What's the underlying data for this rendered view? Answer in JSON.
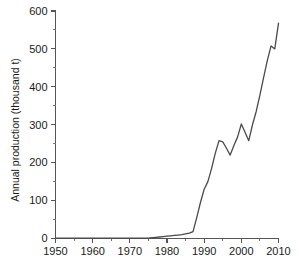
{
  "chart_data": {
    "type": "line",
    "title": "",
    "subtitle": "",
    "xlabel": "",
    "ylabel": "Annual production (thousand t)",
    "xlim": [
      1950,
      2010
    ],
    "ylim": [
      0,
      600
    ],
    "grid": false,
    "legend": null,
    "x_ticks": [
      1950,
      1960,
      1970,
      1980,
      1990,
      2000,
      2010
    ],
    "x_tick_labels": [
      "1950",
      "1960",
      "1970",
      "1980",
      "1990",
      "2000",
      "2010"
    ],
    "x_minor_step": 5,
    "y_ticks": [
      0,
      100,
      200,
      300,
      400,
      500,
      600
    ],
    "y_tick_labels": [
      "0",
      "100",
      "200",
      "300",
      "400",
      "500",
      "600"
    ],
    "y_minor_step": 50,
    "line_color": "#4a4a4a",
    "series": [
      {
        "name": "Annual production",
        "x": [
          1950,
          1951,
          1952,
          1953,
          1954,
          1955,
          1956,
          1957,
          1958,
          1959,
          1960,
          1961,
          1962,
          1963,
          1964,
          1965,
          1966,
          1967,
          1968,
          1969,
          1970,
          1971,
          1972,
          1973,
          1974,
          1975,
          1976,
          1977,
          1978,
          1979,
          1980,
          1981,
          1982,
          1983,
          1984,
          1985,
          1986,
          1987,
          1988,
          1989,
          1990,
          1991,
          1992,
          1993,
          1994,
          1995,
          1996,
          1997,
          1998,
          1999,
          2000,
          2001,
          2002,
          2003,
          2004,
          2005,
          2006,
          2007,
          2008,
          2009,
          2010
        ],
        "y": [
          1,
          1,
          1,
          1,
          1,
          1,
          1,
          1,
          1,
          1,
          1,
          1,
          1,
          1,
          1,
          1,
          1,
          1,
          1,
          1,
          1,
          1,
          1,
          1,
          1,
          1,
          2,
          3,
          4,
          5,
          6,
          7,
          8,
          9,
          10,
          12,
          14,
          18,
          55,
          95,
          130,
          150,
          185,
          225,
          258,
          255,
          238,
          220,
          245,
          268,
          302,
          280,
          258,
          300,
          335,
          378,
          425,
          470,
          508,
          500,
          568
        ]
      }
    ],
    "annotations": [],
    "notable_points": {
      "first_peak_year": 1994,
      "first_peak_value": 258,
      "local_min_year": 1997,
      "local_min_value": 220,
      "second_peak_year": 2000,
      "second_peak_value": 302,
      "second_min_year": 2002,
      "second_min_value": 258,
      "max_year": 2010,
      "max_value": 568
    }
  },
  "axes": {
    "y_title": "Annual production (thousand t)"
  }
}
